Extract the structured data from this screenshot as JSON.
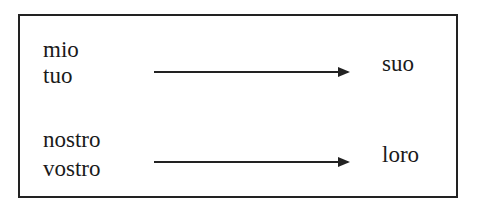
{
  "diagram": {
    "rows": [
      {
        "sources": [
          "mio",
          "tuo"
        ],
        "target": "suo"
      },
      {
        "sources": [
          "nostro",
          "vostro"
        ],
        "target": "loro"
      }
    ]
  }
}
